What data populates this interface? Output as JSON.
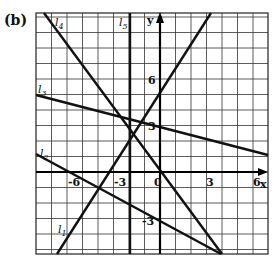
{
  "figure": {
    "part_label": "(b)",
    "axes": {
      "x_label": "x",
      "y_label": "y"
    },
    "x_ticks": [
      {
        "label": "-6",
        "px": 68,
        "py": 186
      },
      {
        "label": "-3",
        "px": 114,
        "py": 186
      },
      {
        "label": "0",
        "px": 154,
        "py": 186
      },
      {
        "label": "3",
        "px": 206,
        "py": 186
      },
      {
        "label": "6",
        "px": 253,
        "py": 186
      }
    ],
    "y_ticks": [
      {
        "label": "6",
        "px": 148,
        "py": 84
      },
      {
        "label": "3",
        "px": 148,
        "py": 130
      },
      {
        "label": "-3",
        "px": 142,
        "py": 225
      }
    ],
    "lines": [
      {
        "name": "l",
        "sub": "1",
        "x1": 57,
        "y1": 254,
        "x2": 211,
        "y2": 13,
        "lx": 58,
        "ly": 233
      },
      {
        "name": "l",
        "sub": "2",
        "x1": 36,
        "y1": 154,
        "x2": 221,
        "y2": 254,
        "lx": 40,
        "ly": 157
      },
      {
        "name": "l",
        "sub": "3",
        "x1": 36,
        "y1": 95,
        "x2": 268,
        "y2": 155,
        "lx": 38,
        "ly": 93
      },
      {
        "name": "l",
        "sub": "4",
        "x1": 44,
        "y1": 13,
        "x2": 222,
        "y2": 254,
        "lx": 55,
        "ly": 26
      },
      {
        "name": "l",
        "sub": "5",
        "x1": 130,
        "y1": 13,
        "x2": 130,
        "y2": 254,
        "lx": 119,
        "ly": 26
      }
    ]
  },
  "chart_data": {
    "type": "line",
    "title": "(b)",
    "xlabel": "x",
    "ylabel": "y",
    "xlim": [
      -8,
      7
    ],
    "ylim": [
      -5.3,
      10.3
    ],
    "grid": true,
    "x_tick_labels": [
      "-6",
      "-3",
      "0",
      "3",
      "6"
    ],
    "y_tick_labels": [
      "-3",
      "3",
      "6"
    ],
    "series": [
      {
        "name": "l1",
        "points": [
          [
            -6.6,
            -5.3
          ],
          [
            3.3,
            10.3
          ]
        ]
      },
      {
        "name": "l2",
        "points": [
          [
            -8,
            1.2
          ],
          [
            3.9,
            -5.3
          ]
        ]
      },
      {
        "name": "l3",
        "points": [
          [
            -8,
            5.0
          ],
          [
            7,
            1.1
          ]
        ]
      },
      {
        "name": "l4",
        "points": [
          [
            -7.5,
            10.3
          ],
          [
            4.0,
            -5.3
          ]
        ]
      },
      {
        "name": "l5",
        "points": [
          [
            -1.9,
            -5.3
          ],
          [
            -1.9,
            10.3
          ]
        ]
      }
    ]
  }
}
